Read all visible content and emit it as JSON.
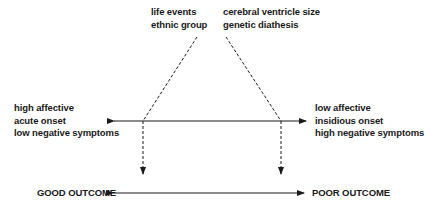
{
  "diagram": {
    "top_left_factors": [
      "life events",
      "ethnic group"
    ],
    "top_right_factors": [
      "cerebral ventricle size",
      "genetic diathesis"
    ],
    "left_features": [
      "high affective",
      "acute onset",
      "low negative symptoms"
    ],
    "right_features": [
      "low affective",
      "insidious onset",
      "high negative symptoms"
    ],
    "outcomes": {
      "good": "GOOD OUTCOME",
      "poor": "POOR OUTCOME"
    },
    "colors": {
      "line": "#1a1a1a",
      "background": "#ffffff"
    }
  }
}
